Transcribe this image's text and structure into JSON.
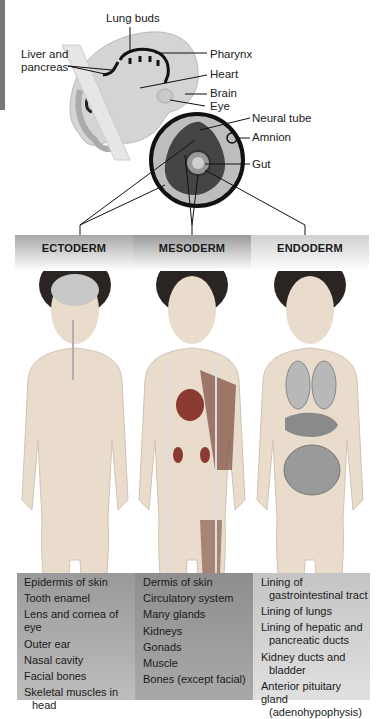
{
  "embryo_labels": {
    "lung_buds": "Lung buds",
    "liver_and_pancreas_line1": "Liver and",
    "liver_and_pancreas_line2": "pancreas",
    "pharynx": "Pharynx",
    "heart": "Heart",
    "brain": "Brain",
    "eye": "Eye",
    "neural_tube": "Neural tube",
    "amnion": "Amnion",
    "gut": "Gut"
  },
  "germ_layers": [
    {
      "name": "ECTODERM",
      "derivatives": [
        [
          "Epidermis of skin"
        ],
        [
          "Tooth enamel"
        ],
        [
          "Lens and cornea of eye"
        ],
        [
          "Outer ear"
        ],
        [
          "Nasal cavity"
        ],
        [
          "Facial bones"
        ],
        [
          "Skeletal muscles in",
          "head"
        ]
      ]
    },
    {
      "name": "MESODERM",
      "derivatives": [
        [
          "Dermis of skin"
        ],
        [
          "Circulatory system"
        ],
        [
          "Many glands"
        ],
        [
          "Kidneys"
        ],
        [
          "Gonads"
        ],
        [
          "Muscle"
        ],
        [
          "Bones (except facial)"
        ]
      ]
    },
    {
      "name": "ENDODERM",
      "derivatives": [
        [
          "Lining of",
          "gastrointestinal tract"
        ],
        [
          "Lining of lungs"
        ],
        [
          "Lining of hepatic and",
          "pancreatic ducts"
        ],
        [
          "Kidney ducts and",
          "bladder"
        ],
        [
          "Anterior pituitary gland",
          "(adenohypophysis)"
        ]
      ]
    }
  ],
  "colors": {
    "skin": "#e9dccd",
    "hair": "#2a2522",
    "organ_gray": "#8a8a8a",
    "band_dark": "#9a9a9a",
    "band_light": "#d0d0d0"
  }
}
